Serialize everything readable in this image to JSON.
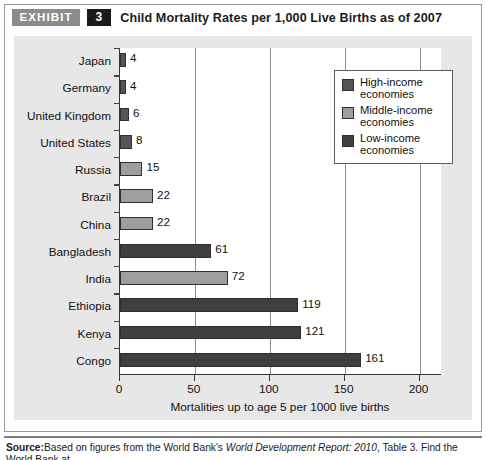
{
  "header": {
    "exhibit_label": "EXHIBIT",
    "exhibit_number": "3",
    "title": "Child Mortality Rates per 1,000 Live Births as of 2007"
  },
  "legend": {
    "items": [
      {
        "label": "High-income\neconomies",
        "color": "#555555"
      },
      {
        "label": "Middle-income\neconomies",
        "color": "#9e9e9e"
      },
      {
        "label": "Low-income\neconomies",
        "color": "#3f3f3f"
      }
    ]
  },
  "footer": {
    "source_label": "Source:",
    "source_text_1": "Based on figures from the World Bank's ",
    "source_italic": "World Development Report: 2010",
    "source_text_2": ", Table 3. Find the World Bank at",
    "source_url": "http://www.worldbank.org."
  },
  "chart_data": {
    "type": "bar",
    "orientation": "horizontal",
    "title": "Child Mortality Rates per 1,000 Live Births as of 2007",
    "xlabel": "Mortalities up to age 5 per 1000 live births",
    "ylabel": "",
    "xlim": [
      0,
      215
    ],
    "xticks": [
      0,
      50,
      100,
      150,
      200
    ],
    "xtick_labels": [
      "0",
      "50",
      "100",
      "150",
      "200"
    ],
    "grid": "vertical",
    "legend_position": "upper-right",
    "categories": [
      "Japan",
      "Germany",
      "United Kingdom",
      "United States",
      "Russia",
      "Brazil",
      "China",
      "Bangladesh",
      "India",
      "Ethiopia",
      "Kenya",
      "Congo"
    ],
    "values": [
      4,
      4,
      6,
      8,
      15,
      22,
      22,
      61,
      72,
      119,
      121,
      161
    ],
    "groups": [
      "High-income economies",
      "High-income economies",
      "High-income economies",
      "High-income economies",
      "Middle-income economies",
      "Middle-income economies",
      "Middle-income economies",
      "Low-income economies",
      "Middle-income economies",
      "Low-income economies",
      "Low-income economies",
      "Low-income economies"
    ],
    "bar_colors": [
      "#555555",
      "#555555",
      "#555555",
      "#555555",
      "#9e9e9e",
      "#9e9e9e",
      "#9e9e9e",
      "#3f3f3f",
      "#9e9e9e",
      "#3f3f3f",
      "#3f3f3f",
      "#3f3f3f"
    ],
    "value_labels": [
      "4",
      "4",
      "6",
      "8",
      "15",
      "22",
      "22",
      "61",
      "72",
      "119",
      "121",
      "161"
    ]
  }
}
